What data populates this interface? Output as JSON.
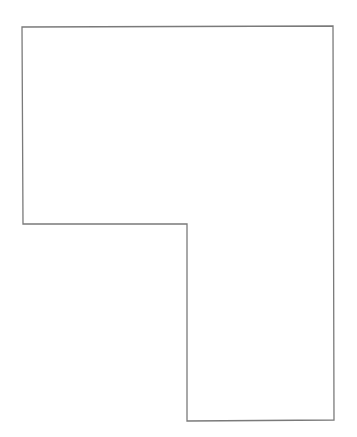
{
  "diagram": {
    "shape": "L-shaped polygon outline",
    "stroke_color": "#7a7a7a",
    "fill_color": "#ffffff",
    "background_color": "#ffffff",
    "points": "22,27 333,26 334,420 187,421 187,224 23,224"
  }
}
